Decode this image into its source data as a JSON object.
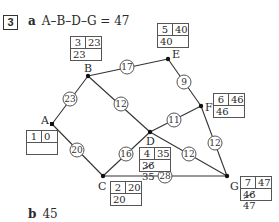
{
  "question": {
    "number": "3",
    "part_a": {
      "label": "a",
      "answer": "A–B–D–G = 47"
    },
    "part_b": {
      "label": "b",
      "answer": "45"
    }
  },
  "nodes": [
    {
      "id": "A",
      "x": 52,
      "y": 124,
      "order": "1",
      "early": "0",
      "late": "",
      "late_struck": ""
    },
    {
      "id": "B",
      "x": 88,
      "y": 76,
      "order": "3",
      "early": "23",
      "late": "23",
      "late_struck": ""
    },
    {
      "id": "C",
      "x": 103,
      "y": 176,
      "order": "2",
      "early": "20",
      "late": "20",
      "late_struck": ""
    },
    {
      "id": "D",
      "x": 150,
      "y": 132,
      "order": "4",
      "early": "35",
      "late": "35",
      "late_struck": "36"
    },
    {
      "id": "E",
      "x": 168,
      "y": 59,
      "order": "5",
      "early": "40",
      "late": "40",
      "late_struck": ""
    },
    {
      "id": "F",
      "x": 201,
      "y": 106,
      "order": "6",
      "early": "46",
      "late": "46",
      "late_struck": ""
    },
    {
      "id": "G",
      "x": 227,
      "y": 176,
      "order": "7",
      "early": "47",
      "late": "47",
      "late_struck": "46"
    }
  ],
  "edges": [
    {
      "from": "A",
      "to": "B",
      "weight": "23"
    },
    {
      "from": "B",
      "to": "E",
      "weight": "17"
    },
    {
      "from": "B",
      "to": "D",
      "weight": "12"
    },
    {
      "from": "E",
      "to": "F",
      "weight": "9"
    },
    {
      "from": "A",
      "to": "C",
      "weight": "20"
    },
    {
      "from": "C",
      "to": "D",
      "weight": "16"
    },
    {
      "from": "D",
      "to": "F",
      "weight": "11"
    },
    {
      "from": "F",
      "to": "G",
      "weight": "12"
    },
    {
      "from": "D",
      "to": "G",
      "weight": "12"
    },
    {
      "from": "C",
      "to": "G",
      "weight": "28"
    }
  ]
}
